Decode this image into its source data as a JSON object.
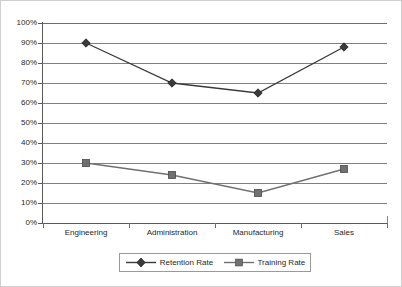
{
  "chart_data": {
    "type": "line",
    "title": "",
    "subtitle": "",
    "xlabel": "",
    "ylabel": "",
    "categories": [
      "Engineering",
      "Administration",
      "Manufacturing",
      "Sales"
    ],
    "series": [
      {
        "name": "Retention Rate",
        "marker": "diamond",
        "color": "#3a3a3a",
        "values": [
          90,
          70,
          65,
          88
        ]
      },
      {
        "name": "Training Rate",
        "marker": "square",
        "color": "#707070",
        "values": [
          30,
          24,
          15,
          27
        ]
      }
    ],
    "ylim": [
      0,
      100
    ],
    "y_ticks": [
      0,
      10,
      20,
      30,
      40,
      50,
      60,
      70,
      80,
      90,
      100
    ],
    "y_tick_labels": [
      "0%",
      "10%",
      "20%",
      "30%",
      "40%",
      "50%",
      "60%",
      "70%",
      "80%",
      "90%",
      "100%"
    ],
    "grid": true,
    "grid_axis": "y",
    "legend_position": "bottom"
  },
  "legend": {
    "entries": [
      {
        "label": "Retention Rate",
        "marker": "diamond-marker-icon"
      },
      {
        "label": "Training Rate",
        "marker": "square-marker-icon"
      }
    ]
  },
  "colors": {
    "retention_series": "#3a3a3a",
    "training_series": "#707070",
    "gridline": "#808080",
    "axis": "#5a5a5a",
    "border": "#cfcfcf",
    "text": "#1f1f1f",
    "background": "#ffffff"
  }
}
